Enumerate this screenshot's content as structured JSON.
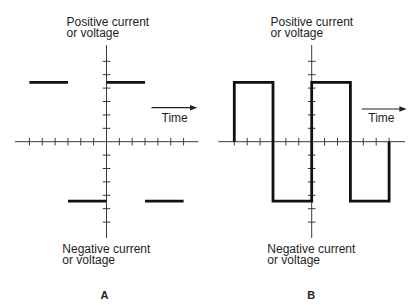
{
  "panels": [
    {
      "caption": "A",
      "positive_label": {
        "line1": "Positive current",
        "line2": "or voltage"
      },
      "negative_label": {
        "line1": "Negative current",
        "line2": "or voltage"
      },
      "time_label": "Time",
      "axes": {
        "divisions_per_side": 6
      },
      "waveform": {
        "amplitude_divisions": 4.43,
        "segments": [
          {
            "from": -6,
            "to": -3,
            "level": 1
          },
          {
            "from": -3,
            "to": 0,
            "level": -1
          },
          {
            "from": 0,
            "to": 3,
            "level": 1
          },
          {
            "from": 3,
            "to": 6,
            "level": -1
          }
        ]
      }
    },
    {
      "caption": "B",
      "positive_label": {
        "line1": "Positive current",
        "line2": "or voltage"
      },
      "negative_label": {
        "line1": "Negative current",
        "line2": "or voltage"
      },
      "time_label": "Time",
      "axes": {
        "divisions_per_side": 6
      },
      "waveform": {
        "amplitude_divisions": 4.43,
        "points": [
          [
            -6,
            0
          ],
          [
            -6,
            1
          ],
          [
            -3,
            1
          ],
          [
            -3,
            -1
          ],
          [
            0,
            -1
          ],
          [
            0,
            1
          ],
          [
            3,
            1
          ],
          [
            3,
            -1
          ],
          [
            6,
            -1
          ],
          [
            6,
            0
          ]
        ]
      }
    }
  ]
}
